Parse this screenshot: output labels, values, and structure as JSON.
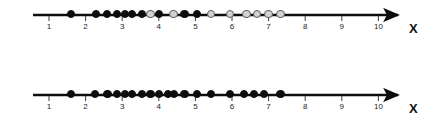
{
  "figure": {
    "title": "",
    "axis_label": "X",
    "background_color": "#ffffff",
    "line_color": "#0d0d0d",
    "filled_dot_color": "#0d0d0d",
    "open_dot_fill": "#d2d2d2",
    "open_dot_border": "#5d5d5d"
  },
  "chart_data": {
    "type": "scatter",
    "title": "",
    "xlabel": "X",
    "ylabel": "",
    "xlim": [
      0.7,
      10.6
    ],
    "grid": false,
    "legend": "none",
    "tick_labels": [
      "1",
      "2",
      "3",
      "4",
      "5",
      "6",
      "7",
      "8",
      "9",
      "10"
    ],
    "ticks": [
      1,
      2,
      3,
      4,
      5,
      6,
      7,
      8,
      9,
      10
    ],
    "series": [
      {
        "name": "top-number-line",
        "row": 0,
        "axis_label": "X",
        "points": [
          {
            "x": 1.6,
            "style": "filled"
          },
          {
            "x": 2.28,
            "style": "filled"
          },
          {
            "x": 2.58,
            "style": "filled"
          },
          {
            "x": 2.85,
            "style": "filled"
          },
          {
            "x": 3.08,
            "style": "filled"
          },
          {
            "x": 3.26,
            "style": "filled"
          },
          {
            "x": 3.54,
            "style": "filled"
          },
          {
            "x": 3.77,
            "style": "open"
          },
          {
            "x": 4.0,
            "style": "filled"
          },
          {
            "x": 4.4,
            "style": "open"
          },
          {
            "x": 4.7,
            "style": "filled"
          },
          {
            "x": 5.05,
            "style": "filled"
          },
          {
            "x": 5.43,
            "style": "open"
          },
          {
            "x": 5.95,
            "style": "open"
          },
          {
            "x": 6.4,
            "style": "open"
          },
          {
            "x": 6.69,
            "style": "open"
          },
          {
            "x": 7.0,
            "style": "open"
          },
          {
            "x": 7.33,
            "style": "open"
          }
        ]
      },
      {
        "name": "bottom-number-line",
        "row": 1,
        "axis_label": "X",
        "points": [
          {
            "x": 1.6,
            "style": "filled"
          },
          {
            "x": 2.26,
            "style": "filled"
          },
          {
            "x": 2.6,
            "style": "filled"
          },
          {
            "x": 2.85,
            "style": "filled"
          },
          {
            "x": 3.08,
            "style": "filled"
          },
          {
            "x": 3.26,
            "style": "filled"
          },
          {
            "x": 3.54,
            "style": "filled"
          },
          {
            "x": 3.77,
            "style": "filled"
          },
          {
            "x": 4.0,
            "style": "filled"
          },
          {
            "x": 4.25,
            "style": "filled"
          },
          {
            "x": 4.42,
            "style": "filled"
          },
          {
            "x": 4.7,
            "style": "filled"
          },
          {
            "x": 5.05,
            "style": "filled"
          },
          {
            "x": 5.43,
            "style": "filled"
          },
          {
            "x": 5.95,
            "style": "filled"
          },
          {
            "x": 6.32,
            "style": "filled"
          },
          {
            "x": 6.6,
            "style": "filled"
          },
          {
            "x": 6.87,
            "style": "filled"
          },
          {
            "x": 7.33,
            "style": "filled"
          }
        ]
      }
    ]
  },
  "geometry": {
    "x_origin_px": 49,
    "unit_px": 36.6,
    "axis_start_px": 33,
    "axis_end_px": 398,
    "rows": [
      {
        "line_y": 15,
        "dot_y": 14,
        "tick_bottom": 21,
        "label_y": 22,
        "axis_label_x": 409,
        "axis_label_y": 22
      },
      {
        "line_y": 95,
        "dot_y": 94,
        "tick_bottom": 101,
        "label_y": 102,
        "axis_label_x": 409,
        "axis_label_y": 102
      }
    ],
    "dot_radius": 4.2,
    "tick_height": 6
  }
}
